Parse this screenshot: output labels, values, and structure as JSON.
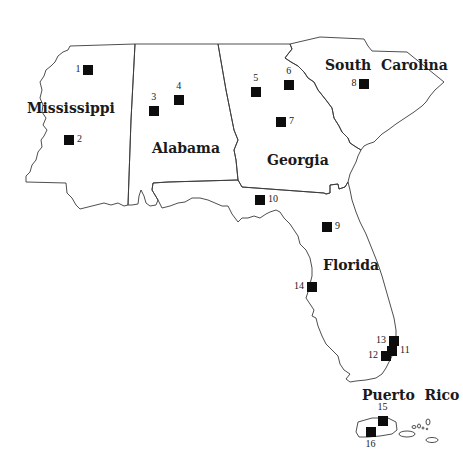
{
  "map": {
    "title": "",
    "states": [
      {
        "name": "Mississippi",
        "label_x": 27,
        "label_y": 100
      },
      {
        "name": "Alabama",
        "label_x": 152,
        "label_y": 140
      },
      {
        "name": "Georgia",
        "label_x": 267,
        "label_y": 152
      },
      {
        "name": "South  Carolina",
        "label_x": 325,
        "label_y": 57
      },
      {
        "name": "Florida",
        "label_x": 323,
        "label_y": 257
      },
      {
        "name": "Puerto  Rico",
        "label_x": 362,
        "label_y": 387
      }
    ],
    "sites": [
      {
        "id": "1",
        "x": 88,
        "y": 70,
        "label_side": "left"
      },
      {
        "id": "2",
        "x": 69,
        "y": 140,
        "label_side": "right"
      },
      {
        "id": "3",
        "x": 154,
        "y": 111,
        "label_side": "top"
      },
      {
        "id": "4",
        "x": 179,
        "y": 100,
        "label_side": "top"
      },
      {
        "id": "5",
        "x": 256,
        "y": 92,
        "label_side": "top"
      },
      {
        "id": "6",
        "x": 289,
        "y": 85,
        "label_side": "top"
      },
      {
        "id": "7",
        "x": 281,
        "y": 122,
        "label_side": "right"
      },
      {
        "id": "8",
        "x": 364,
        "y": 84,
        "label_side": "left"
      },
      {
        "id": "9",
        "x": 327,
        "y": 227,
        "label_side": "right"
      },
      {
        "id": "10",
        "x": 260,
        "y": 200,
        "label_side": "right"
      },
      {
        "id": "11",
        "x": 392,
        "y": 351,
        "label_side": "right"
      },
      {
        "id": "12",
        "x": 386,
        "y": 356,
        "label_side": "left"
      },
      {
        "id": "13",
        "x": 394,
        "y": 341,
        "label_side": "left"
      },
      {
        "id": "14",
        "x": 312,
        "y": 287,
        "label_side": "left"
      },
      {
        "id": "15",
        "x": 383,
        "y": 421,
        "label_side": "top"
      },
      {
        "id": "16",
        "x": 371,
        "y": 432,
        "label_side": "bottom"
      }
    ],
    "colors": {
      "marker": "#0d0d0d",
      "border": "#3a3a3a",
      "background": "#ffffff"
    }
  }
}
